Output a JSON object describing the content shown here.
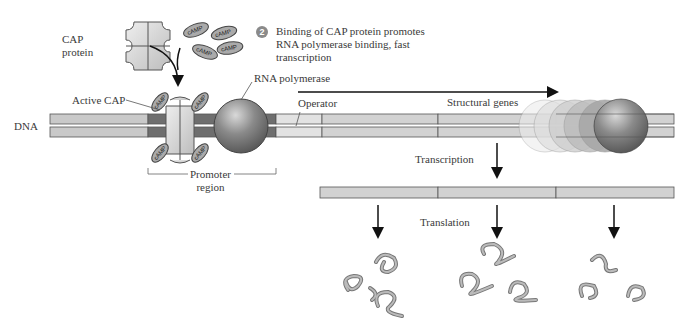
{
  "labels": {
    "cap_protein": [
      "CAP",
      "protein"
    ],
    "camp": "cAMP",
    "step_number": "2",
    "step_caption": [
      "Binding of CAP protein promotes",
      "RNA polymerase binding, fast",
      "transcription"
    ],
    "rna_polymerase": "RNA polymerase",
    "active_cap": "Active CAP",
    "dna": "DNA",
    "operator": "Operator",
    "structural_genes": "Structural genes",
    "promoter_region": [
      "Promoter",
      "region"
    ],
    "transcription": "Transcription",
    "translation": "Translation"
  },
  "colors": {
    "dna_light": "#c9c9c9",
    "dna_promoter": "#6e6e6e",
    "dna_operator": "#e2e2e2",
    "polymerase": "#7a7a7a",
    "cap_protein": "#d4d4d4",
    "protein_chain": "#8c8c8c",
    "outline": "#4a4a4a"
  },
  "diagram": {
    "structural_gene_count": 3,
    "mrna_segments": 3,
    "protein_groups": 3
  }
}
